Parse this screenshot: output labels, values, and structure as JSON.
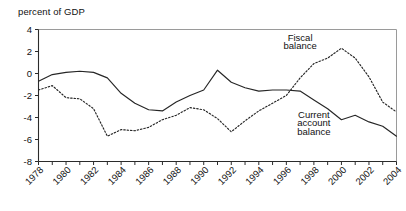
{
  "chart_data": {
    "type": "line",
    "title": "",
    "ylabel": "percent of GDP",
    "xlabel": "",
    "ylim": [
      -8,
      4
    ],
    "yticks": [
      4,
      2,
      0,
      -2,
      -4,
      -6,
      -8
    ],
    "ytick_labels": [
      "4",
      "2",
      "0",
      "-2",
      "-4",
      "-6",
      "-8"
    ],
    "xlim": [
      1978,
      2004
    ],
    "xticks": [
      1978,
      1979,
      1980,
      1981,
      1982,
      1983,
      1984,
      1985,
      1986,
      1987,
      1988,
      1989,
      1990,
      1991,
      1992,
      1993,
      1994,
      1995,
      1996,
      1997,
      1998,
      1999,
      2000,
      2001,
      2002,
      2003,
      2004
    ],
    "xtick_labels": [
      "1978",
      "1980",
      "1982",
      "1984",
      "1986",
      "1988",
      "1990",
      "1992",
      "1994",
      "1996",
      "1998",
      "2000",
      "2002",
      "2004"
    ],
    "xtick_label_years": [
      1978,
      1980,
      1982,
      1984,
      1986,
      1988,
      1990,
      1992,
      1994,
      1996,
      1998,
      2000,
      2002,
      2004
    ],
    "grid": false,
    "legend_position": "inline-annotation",
    "x": [
      1978,
      1979,
      1980,
      1981,
      1982,
      1983,
      1984,
      1985,
      1986,
      1987,
      1988,
      1989,
      1990,
      1991,
      1992,
      1993,
      1994,
      1995,
      1996,
      1997,
      1998,
      1999,
      2000,
      2001,
      2002,
      2003,
      2004
    ],
    "series": [
      {
        "name": "Fiscal balance",
        "style": "dotted",
        "color": "#262626",
        "values": [
          -1.5,
          -1.1,
          -2.2,
          -2.3,
          -3.2,
          -5.7,
          -5.1,
          -5.2,
          -4.9,
          -4.2,
          -3.8,
          -3.1,
          -3.3,
          -4.1,
          -5.3,
          -4.3,
          -3.4,
          -2.7,
          -2.0,
          -0.4,
          0.9,
          1.4,
          2.3,
          1.4,
          -0.3,
          -2.6,
          -3.5
        ]
      },
      {
        "name": "Current account balance",
        "style": "solid",
        "color": "#262626",
        "values": [
          -0.7,
          -0.1,
          0.1,
          0.2,
          0.1,
          -0.4,
          -1.8,
          -2.7,
          -3.3,
          -3.4,
          -2.6,
          -2.0,
          -1.5,
          0.3,
          -0.8,
          -1.3,
          -1.6,
          -1.5,
          -1.5,
          -1.6,
          -2.4,
          -3.2,
          -4.2,
          -3.8,
          -4.4,
          -4.8,
          -5.7
        ]
      }
    ],
    "annotations": [
      {
        "text": "Fiscal",
        "series": "Fiscal balance",
        "x": 1997,
        "y": 3.0
      },
      {
        "text": "balance",
        "series": "Fiscal balance",
        "x": 1997,
        "y": 2.2
      },
      {
        "text": "Current",
        "series": "Current account balance",
        "x": 1998,
        "y": -4.0
      },
      {
        "text": "account",
        "series": "Current account balance",
        "x": 1998,
        "y": -4.8
      },
      {
        "text": "balance",
        "series": "Current account balance",
        "x": 1998,
        "y": -5.6
      }
    ]
  },
  "labels": {
    "fiscal_line1": "Fiscal",
    "fiscal_line2": "balance",
    "current_line1": "Current",
    "current_line2": "account",
    "current_line3": "balance",
    "axis_title": "percent of GDP"
  }
}
